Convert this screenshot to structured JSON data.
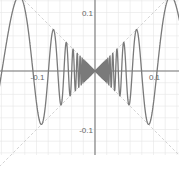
{
  "chart_data": {
    "type": "line",
    "title": "",
    "xlabel": "",
    "ylabel": "",
    "function_assumed": "y = x * sin(1/x)",
    "function_assumed_note": "Inferred from curve shape; no equation is visible in the screenshot.",
    "envelope_assumed": [
      "y = x",
      "y = -x"
    ],
    "envelope_note": "Dashed diagonal guide lines through the origin; slopes assumed to be +/-1, not read from pixels.",
    "xlim": [
      -0.16,
      0.14
    ],
    "ylim": [
      -0.14,
      0.12
    ],
    "x_ticks": [
      {
        "value": -0.1,
        "label": "-0.1"
      },
      {
        "value": 0.1,
        "label": "0.1"
      }
    ],
    "y_ticks": [
      {
        "value": 0.1,
        "label": "0.1"
      },
      {
        "value": -0.1,
        "label": "-0.1"
      }
    ],
    "grid": true,
    "grid_step": 0.02,
    "legend": null,
    "series": [
      {
        "name": "curve",
        "color": "#777777",
        "style": "solid"
      },
      {
        "name": "envelope",
        "color": "#cccccc",
        "style": "dashed"
      }
    ]
  },
  "layout": {
    "origin_px": {
      "x": 95,
      "y": 71
    },
    "px_per_unit": 585,
    "plot_bottom_px": 155
  },
  "colors": {
    "background": "#ffffff",
    "grid": "#e6e6e6",
    "axis": "#777777",
    "curve": "#7a7a7a",
    "envelope": "#cfcfcf",
    "tick_text": "#666666"
  }
}
